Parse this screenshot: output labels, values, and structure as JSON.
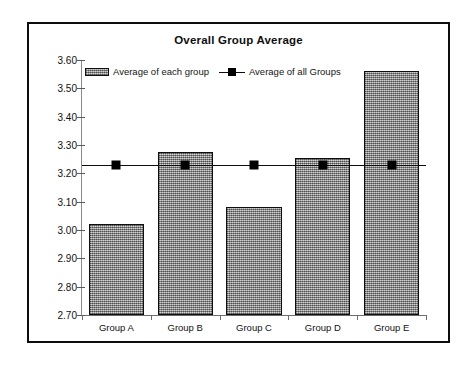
{
  "chart_data": {
    "type": "bar",
    "title": "Overall Group Average",
    "xlabel": "",
    "ylabel": "",
    "categories": [
      "Group A",
      "Group B",
      "Group C",
      "Group D",
      "Group E"
    ],
    "ylim": [
      2.7,
      3.6
    ],
    "ytick_labels": [
      "3.60",
      "3.50",
      "3.40",
      "3.30",
      "3.20",
      "3.10",
      "3.00",
      "2.90",
      "2.80",
      "2.70"
    ],
    "ytick_values": [
      3.6,
      3.5,
      3.4,
      3.3,
      3.2,
      3.1,
      3.0,
      2.9,
      2.8,
      2.7
    ],
    "grid": false,
    "legend_position": "top-center",
    "series": [
      {
        "name": "Average of each group",
        "type": "bar",
        "values": [
          3.02,
          3.275,
          3.08,
          3.255,
          3.56
        ],
        "color": "#9a9a9a",
        "edge_color": "#0e0e0e"
      },
      {
        "name": "Average of all Groups",
        "type": "line",
        "values": [
          3.23,
          3.23,
          3.23,
          3.23,
          3.23
        ],
        "color": "#000000",
        "marker": "square"
      }
    ]
  },
  "legend": {
    "entries": [
      {
        "label": "Average of each group",
        "swatch": "bar-swatch"
      },
      {
        "label": "Average of all Groups",
        "swatch": "line-marker-swatch"
      }
    ]
  },
  "colors": {
    "frame_border": "#0d0d0d",
    "bar_fill": "#9a9a9a",
    "line": "#000000",
    "background": "#ffffff"
  }
}
